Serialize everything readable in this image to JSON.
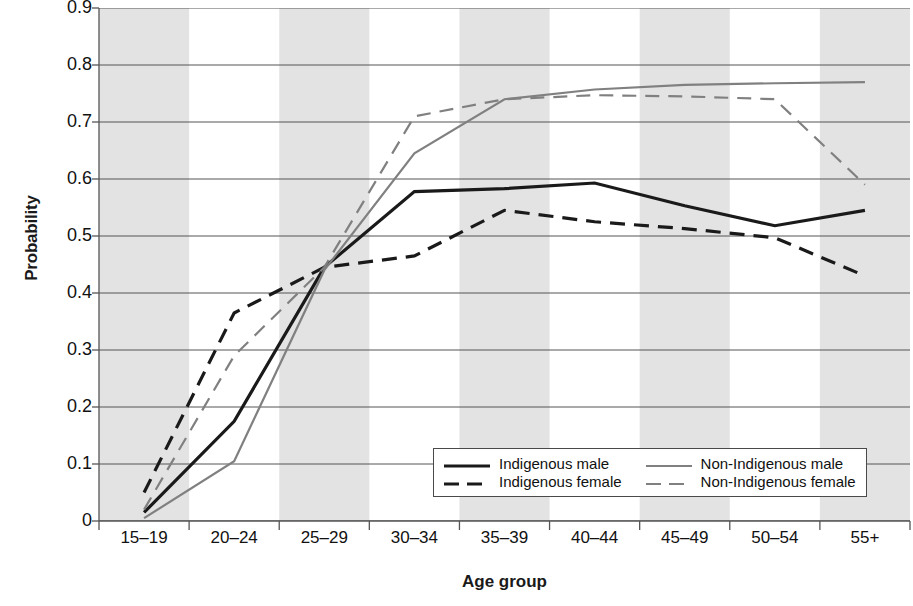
{
  "chart_data": {
    "type": "line",
    "title": "",
    "xlabel": "Age group",
    "ylabel": "Probability",
    "categories": [
      "15–19",
      "20–24",
      "25–29",
      "30–34",
      "35–39",
      "40–44",
      "45–49",
      "50–54",
      "55+"
    ],
    "ylim": [
      0,
      0.9
    ],
    "yticks": [
      "0",
      "0.1",
      "0.2",
      "0.3",
      "0.4",
      "0.5",
      "0.6",
      "0.7",
      "0.8",
      "0.9"
    ],
    "ytick_values": [
      0,
      0.1,
      0.2,
      0.3,
      0.4,
      0.5,
      0.6,
      0.7,
      0.8,
      0.9
    ],
    "grid": "horizontal",
    "banding": "alternating vertical grey bands per age group",
    "legend_position": "inside lower right",
    "series": [
      {
        "name": "Indigenous male",
        "color": "#1a1a1a",
        "style": "solid",
        "values": [
          0.015,
          0.175,
          0.445,
          0.578,
          0.583,
          0.593,
          0.553,
          0.518,
          0.545
        ]
      },
      {
        "name": "Indigenous female",
        "color": "#1a1a1a",
        "style": "dashed",
        "values": [
          0.05,
          0.365,
          0.445,
          0.465,
          0.545,
          0.525,
          0.513,
          0.497,
          0.43
        ]
      },
      {
        "name": "Non-Indigenous male",
        "color": "#808080",
        "style": "solid",
        "values": [
          0.005,
          0.105,
          0.44,
          0.645,
          0.74,
          0.757,
          0.765,
          0.768,
          0.77
        ]
      },
      {
        "name": "Non-Indigenous female",
        "color": "#808080",
        "style": "dashed",
        "values": [
          0.02,
          0.29,
          0.445,
          0.71,
          0.74,
          0.747,
          0.745,
          0.74,
          0.59
        ]
      }
    ]
  },
  "colors": {
    "indigenous": "#1a1a1a",
    "non_indigenous": "#808080",
    "band": "#e3e3e3",
    "gridline": "#555555",
    "axis": "#555555"
  }
}
